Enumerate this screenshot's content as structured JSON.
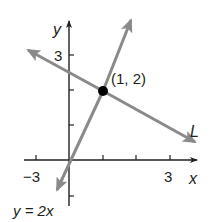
{
  "diagram": {
    "type": "coordinate-plane",
    "axes": {
      "x_label": "x",
      "y_label": "y",
      "x_tick_labels": [
        {
          "value": -3,
          "text": "−3"
        },
        {
          "value": 3,
          "text": "3"
        }
      ],
      "y_tick_labels": [
        {
          "value": 3,
          "text": "3"
        }
      ],
      "x_ticks": [
        -3,
        1,
        2,
        3
      ],
      "y_ticks": [
        -1,
        1,
        2,
        3
      ],
      "axis_color": "#231f20"
    },
    "lines": [
      {
        "name": "y = 2x",
        "label": "y = 2x",
        "equation": "y = 2x",
        "color": "#8a8a8a"
      },
      {
        "name": "L",
        "label": "L",
        "color": "#8a8a8a"
      }
    ],
    "point": {
      "label": "(1, 2)",
      "x": 1,
      "y": 2,
      "color": "#000000"
    }
  }
}
